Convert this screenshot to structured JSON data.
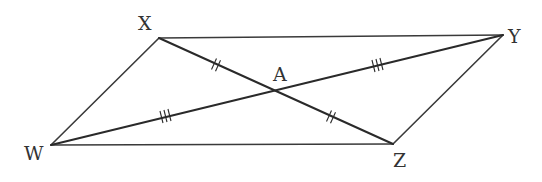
{
  "figure": {
    "colors": {
      "line": "#2a2a2a",
      "label": "#333333",
      "background": "#ffffff"
    },
    "vertices": {
      "X": {
        "label": "X",
        "x": 159,
        "y": 38
      },
      "Y": {
        "label": "Y",
        "x": 503,
        "y": 35
      },
      "Z": {
        "label": "Z",
        "x": 393,
        "y": 144
      },
      "W": {
        "label": "W",
        "x": 51,
        "y": 145
      },
      "A": {
        "label": "A",
        "x": 273,
        "y": 90
      }
    },
    "edges": [
      {
        "from": "X",
        "to": "Y"
      },
      {
        "from": "Y",
        "to": "Z"
      },
      {
        "from": "Z",
        "to": "W"
      },
      {
        "from": "W",
        "to": "X"
      }
    ],
    "diagonals": [
      {
        "from": "X",
        "to": "Z",
        "marks": "double tick on XA and AZ"
      },
      {
        "from": "W",
        "to": "Y",
        "marks": "triple tick on WA and AY"
      }
    ],
    "tick_marks": [
      {
        "segment": "XA",
        "count": 2
      },
      {
        "segment": "AZ",
        "count": 2
      },
      {
        "segment": "WA",
        "count": 3
      },
      {
        "segment": "AY",
        "count": 3
      }
    ]
  }
}
